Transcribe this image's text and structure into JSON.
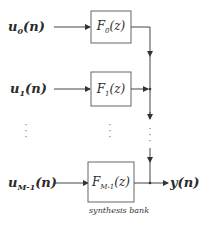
{
  "diagram": {
    "type": "synthesis filter bank block diagram",
    "inputs": [
      {
        "symbol": "u",
        "sub": "0",
        "arg": "(n)"
      },
      {
        "symbol": "u",
        "sub": "1",
        "arg": "(n)"
      },
      {
        "symbol": "u",
        "sub": "M-1",
        "arg": "(n)"
      }
    ],
    "filters": [
      {
        "symbol": "F",
        "sub": "0",
        "arg": "(z)"
      },
      {
        "symbol": "F",
        "sub": "1",
        "arg": "(z)"
      },
      {
        "symbol": "F",
        "sub": "M-1",
        "arg": "(z)"
      }
    ],
    "output": {
      "label": "y(n)"
    },
    "ellipsis": "·\n·\n·",
    "caption": "synthesis bank",
    "colors": {
      "line": "#3a3a3a",
      "box_border": "#555555",
      "background": "#ffffff"
    }
  }
}
